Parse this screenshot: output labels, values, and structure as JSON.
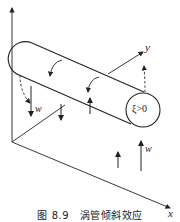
{
  "diagram": {
    "axes": {
      "z_label": "",
      "y_label": "y",
      "x_label": "x"
    },
    "tube": {
      "end_label": "ξ>0"
    },
    "arrows": {
      "w_left": "w",
      "w_right": "w"
    },
    "colors": {
      "stroke": "#222222",
      "background": "#ffffff"
    }
  },
  "caption": "图 8.9　涡管倾斜效应"
}
